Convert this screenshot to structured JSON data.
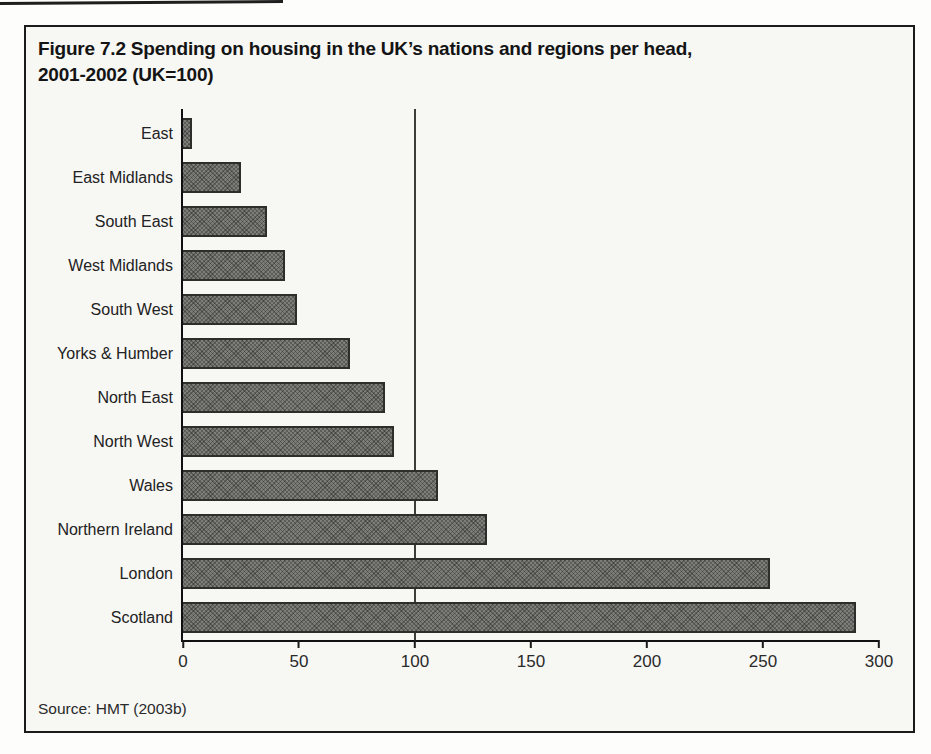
{
  "figure": {
    "title_line1": "Figure 7.2 Spending on housing in the UK’s nations and regions per head,",
    "title_line2": "2001-2002 (UK=100)",
    "source": "Source: HMT (2003b)"
  },
  "chart_data": {
    "type": "bar",
    "orientation": "horizontal",
    "title": "Figure 7.2 Spending on housing in the UK’s nations and regions per head, 2001-2002 (UK=100)",
    "categories": [
      "East",
      "East Midlands",
      "South East",
      "West Midlands",
      "South West",
      "Yorks & Humber",
      "North East",
      "North West",
      "Wales",
      "Northern Ireland",
      "London",
      "Scotland"
    ],
    "values": [
      4,
      25,
      36,
      44,
      49,
      72,
      87,
      91,
      110,
      131,
      253,
      290
    ],
    "xlabel": "",
    "ylabel": "",
    "xlim": [
      0,
      300
    ],
    "xticks": [
      0,
      50,
      100,
      150,
      200,
      250,
      300
    ],
    "reference_line_x": 100,
    "grid": false,
    "legend": "none",
    "bar_fill": "#7d7d79",
    "bar_border": "#2d2d2b",
    "axis_color": "#1b1b1b",
    "source": "Source: HMT (2003b)"
  }
}
